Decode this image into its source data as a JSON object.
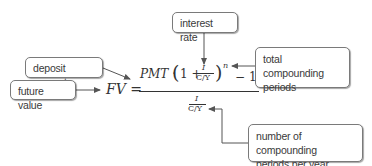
{
  "callouts": {
    "interest_rate": "interest rate",
    "deposit_amount": "deposit amount",
    "future_value": "future value",
    "total_periods_line1": "total compounding",
    "total_periods_line2": "periods",
    "periods_per_year_line1": "number of compounding",
    "periods_per_year_line2": "periods per year"
  },
  "formula": {
    "lhs": "FV",
    "equals": "=",
    "pmt": "PMT",
    "dot": "·",
    "open_paren": "(",
    "one": "1",
    "plus": "+",
    "rate_num": "I",
    "rate_den": "C/Y",
    "close_paren": ")",
    "exponent": "n",
    "minus": "−",
    "minus_one": "1",
    "den_num": "I",
    "den_den": "C/Y"
  },
  "colors": {
    "text": "#333333",
    "border": "#7a7a7a",
    "arrow": "#555555"
  }
}
